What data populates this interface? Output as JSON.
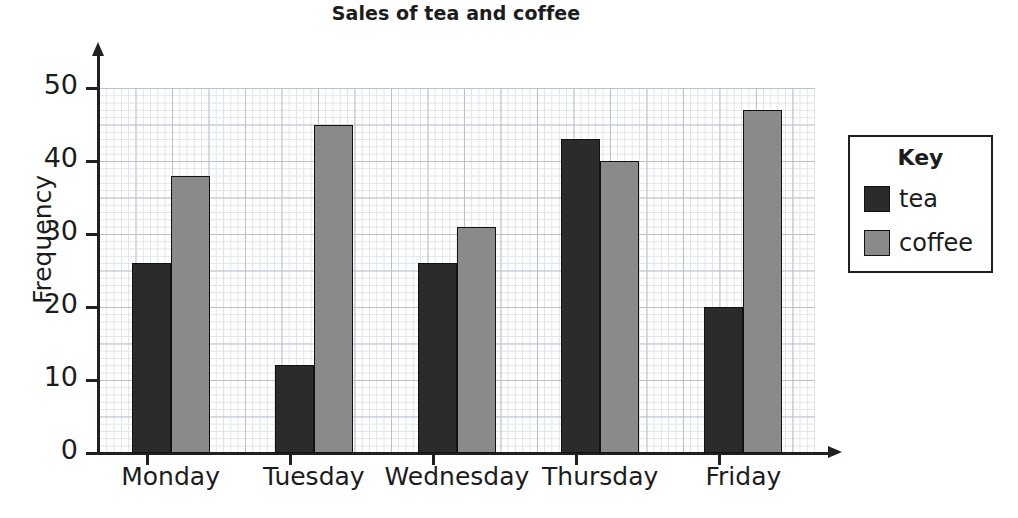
{
  "chart_data": {
    "type": "bar",
    "title": "Sales of tea and coffee",
    "xlabel": "",
    "ylabel": "Frequency",
    "categories": [
      "Monday",
      "Tuesday",
      "Wednesday",
      "Thursday",
      "Friday"
    ],
    "series": [
      {
        "name": "tea",
        "color": "#2b2b2b",
        "values": [
          26,
          12,
          26,
          43,
          20
        ]
      },
      {
        "name": "coffee",
        "color": "#8a8a8a",
        "values": [
          38,
          45,
          31,
          40,
          47
        ]
      }
    ],
    "ylim": [
      0,
      50
    ],
    "ytick_labels": [
      "0",
      "10",
      "20",
      "30",
      "40",
      "50"
    ],
    "ytick_values": [
      0,
      10,
      20,
      30,
      40,
      50
    ],
    "grid": true,
    "grid_style": "graph-paper",
    "legend_position": "right-outside"
  },
  "legend": {
    "title": "Key",
    "entries": [
      {
        "label": "tea",
        "color": "#2b2b2b"
      },
      {
        "label": "coffee",
        "color": "#8a8a8a"
      }
    ]
  }
}
